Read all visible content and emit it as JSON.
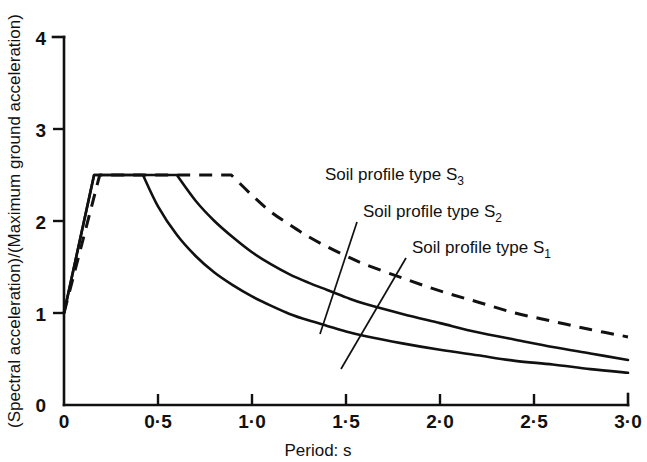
{
  "chart_data": {
    "type": "line",
    "title": "",
    "xlabel": "Period: s",
    "ylabel": "(Spectral acceleration)/(Maximum ground acceleration)",
    "xlim": [
      0,
      3.0
    ],
    "ylim": [
      0,
      4
    ],
    "xticks": [
      0,
      0.5,
      1.0,
      1.5,
      2.0,
      2.5,
      3.0
    ],
    "xticklabels": [
      "0",
      "0·5",
      "1·0",
      "1·5",
      "2·0",
      "2·5",
      "3·0"
    ],
    "yticks": [
      0,
      1,
      2,
      3,
      4
    ],
    "yticklabels": [
      "0",
      "1",
      "2",
      "3",
      "4"
    ],
    "grid": false,
    "legend_position": "inline-annotations",
    "plateau_value": 2.5,
    "origin_value": 1.0,
    "series": [
      {
        "name": "Soil profile type S1",
        "label": "Soil profile type S",
        "subscript": "1",
        "style": "solid",
        "color": "#111111",
        "plateau_start": 0.16,
        "plateau_end": 0.42,
        "end_value": 0.35,
        "x": [
          0,
          0.16,
          0.42,
          0.5,
          0.6,
          0.7,
          0.8,
          0.9,
          1.0,
          1.1,
          1.2,
          1.3,
          1.4,
          1.5,
          1.6,
          1.8,
          2.0,
          2.2,
          2.4,
          2.6,
          2.8,
          3.0
        ],
        "values": [
          1.0,
          2.5,
          2.5,
          2.16,
          1.85,
          1.62,
          1.44,
          1.3,
          1.18,
          1.08,
          0.99,
          0.92,
          0.86,
          0.8,
          0.75,
          0.67,
          0.6,
          0.54,
          0.48,
          0.44,
          0.39,
          0.35
        ]
      },
      {
        "name": "Soil profile type S2",
        "label": "Soil profile type S",
        "subscript": "2",
        "style": "solid",
        "color": "#111111",
        "plateau_start": 0.16,
        "plateau_end": 0.6,
        "end_value": 0.49,
        "x": [
          0,
          0.16,
          0.6,
          0.7,
          0.8,
          0.9,
          1.0,
          1.1,
          1.2,
          1.3,
          1.4,
          1.5,
          1.6,
          1.8,
          2.0,
          2.2,
          2.4,
          2.6,
          2.8,
          3.0
        ],
        "values": [
          1.0,
          2.5,
          2.5,
          2.22,
          2.0,
          1.82,
          1.66,
          1.53,
          1.42,
          1.33,
          1.25,
          1.17,
          1.1,
          0.99,
          0.89,
          0.79,
          0.71,
          0.63,
          0.56,
          0.49
        ]
      },
      {
        "name": "Soil profile type S3",
        "label": "Soil profile type S",
        "subscript": "3",
        "style": "dashed",
        "color": "#111111",
        "plateau_start": 0.19,
        "plateau_end": 0.89,
        "end_value": 0.74,
        "x": [
          0,
          0.19,
          0.89,
          1.0,
          1.1,
          1.2,
          1.3,
          1.4,
          1.5,
          1.6,
          1.8,
          2.0,
          2.2,
          2.4,
          2.6,
          2.8,
          3.0
        ],
        "values": [
          1.0,
          2.5,
          2.5,
          2.28,
          2.1,
          1.96,
          1.83,
          1.72,
          1.62,
          1.53,
          1.38,
          1.24,
          1.12,
          1.0,
          0.91,
          0.82,
          0.74
        ]
      }
    ],
    "annotations": [
      {
        "name": "label-s3",
        "text": "Soil profile type S",
        "subscript": "3",
        "text_x": 325,
        "text_y": 180,
        "leader": null
      },
      {
        "name": "label-s2",
        "text": "Soil profile type S",
        "subscript": "2",
        "text_x": 363,
        "text_y": 217,
        "leader": [
          [
            357,
            222
          ],
          [
            320,
            334
          ]
        ]
      },
      {
        "name": "label-s1",
        "text": "Soil profile type S",
        "subscript": "1",
        "text_x": 412,
        "text_y": 253,
        "leader": [
          [
            406,
            258
          ],
          [
            341,
            369
          ]
        ]
      }
    ]
  }
}
